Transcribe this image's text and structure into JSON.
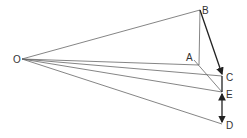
{
  "diagram": {
    "type": "vector-geometry",
    "points": {
      "O": {
        "label": "O",
        "x": 22,
        "y": 59
      },
      "B": {
        "label": "B",
        "x": 200,
        "y": 10
      },
      "A": {
        "label": "A",
        "x": 199,
        "y": 65
      },
      "C": {
        "label": "C",
        "x": 222,
        "y": 76
      },
      "E": {
        "label": "E",
        "x": 222,
        "y": 92
      },
      "D": {
        "label": "D",
        "x": 222,
        "y": 124
      }
    },
    "labels": {
      "O": "O",
      "B": "B",
      "A": "A",
      "C": "C",
      "E": "E",
      "D": "D"
    },
    "colors": {
      "line": "#555555",
      "bold": "#222222",
      "text": "#333333"
    }
  }
}
